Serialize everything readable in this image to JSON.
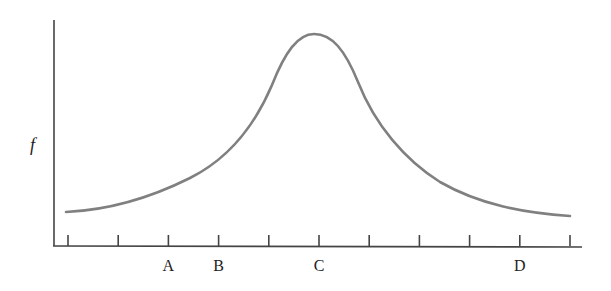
{
  "chart_data": {
    "type": "line",
    "title": "",
    "xlabel": "",
    "ylabel": "f",
    "x_tick_count": 11,
    "x_tick_labels": [
      {
        "tick_index": 2,
        "label": "A"
      },
      {
        "tick_index": 3,
        "label": "B"
      },
      {
        "tick_index": 5,
        "label": "C"
      },
      {
        "tick_index": 9,
        "label": "D"
      }
    ],
    "series": [
      {
        "name": "f",
        "description": "Asymmetric bell-shaped curve peaking at C, low tails at both ends",
        "x": [
          0,
          1,
          2,
          3,
          4,
          5,
          6,
          7,
          8,
          9,
          10
        ],
        "values": [
          0.15,
          0.2,
          0.3,
          0.45,
          0.72,
          1.0,
          0.62,
          0.38,
          0.24,
          0.16,
          0.13
        ]
      }
    ],
    "grid": false,
    "legend": null,
    "color": "#808080"
  }
}
